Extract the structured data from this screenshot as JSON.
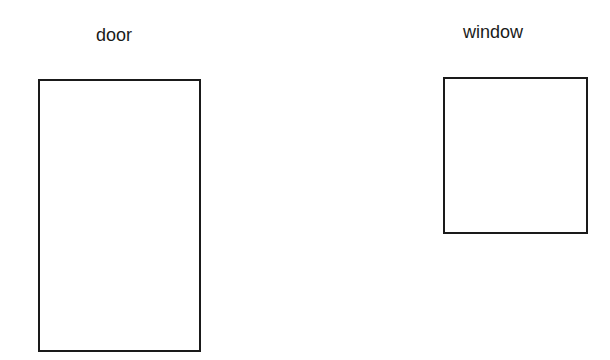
{
  "diagram": {
    "items": [
      {
        "label": "door",
        "shape": "rectangle"
      },
      {
        "label": "window",
        "shape": "rectangle"
      }
    ]
  }
}
